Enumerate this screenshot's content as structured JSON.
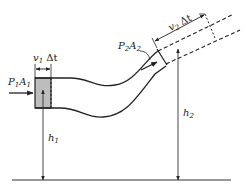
{
  "diagram": {
    "title": "",
    "labels": {
      "p1a1": {
        "main": "P",
        "sub1": "1",
        "mid": "A",
        "sub2": "1"
      },
      "p2a2": {
        "main": "P",
        "sub1": "2",
        "mid": "A",
        "sub2": "2"
      },
      "v1dt": {
        "main": "v",
        "sub": "1",
        "rest": " Δt"
      },
      "v2dt": {
        "main": "v",
        "sub": "2",
        "rest": " Δt"
      },
      "h1": {
        "main": "h",
        "sub": "1"
      },
      "h2": {
        "main": "h",
        "sub": "2"
      }
    },
    "colors": {
      "stroke": "#222222",
      "shade": "#bdbdbd",
      "background": "#ffffff"
    }
  }
}
